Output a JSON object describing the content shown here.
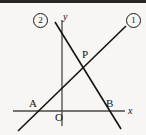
{
  "figure": {
    "background_color": "#f7f6f4",
    "ink_color": "#15120f",
    "width": 146,
    "height": 135
  },
  "axes": {
    "x_axis_label": "x",
    "y_axis_label": "y",
    "origin_label": "O",
    "x_axis": {
      "x1": 13,
      "y1": 111,
      "x2": 125,
      "y2": 111
    },
    "y_axis": {
      "x1": 62,
      "y1": 20,
      "x2": 62,
      "y2": 126
    }
  },
  "lines": [
    {
      "id": "line-1",
      "label": "1",
      "description": "rising line through A and P",
      "x1": 18,
      "y1": 131,
      "x2": 126,
      "y2": 26
    },
    {
      "id": "line-2",
      "label": "2",
      "description": "falling line through P and B",
      "x1": 55,
      "y1": 22,
      "x2": 121,
      "y2": 129
    }
  ],
  "points": [
    {
      "name": "A",
      "label": "A",
      "x": 38,
      "y": 111,
      "label_x": 29,
      "label_y": 98
    },
    {
      "name": "B",
      "label": "B",
      "x": 113,
      "y": 111,
      "label_x": 106,
      "label_y": 98
    },
    {
      "name": "P",
      "label": "P",
      "x": 82,
      "y": 64,
      "label_x": 82,
      "label_y": 49
    }
  ],
  "line_markers": [
    {
      "label": "1",
      "x": 126,
      "y": 13
    },
    {
      "label": "2",
      "x": 33,
      "y": 13
    }
  ]
}
